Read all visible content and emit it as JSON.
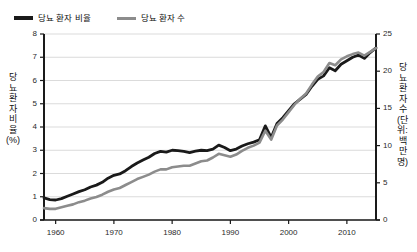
{
  "legend": {
    "position": "top-left",
    "items": [
      {
        "label": "당뇨 환자 비율",
        "color": "#1a1a1a",
        "icon": "line-swatch-icon"
      },
      {
        "label": "당뇨 환자 수",
        "color": "#8c8c8c",
        "icon": "line-swatch-icon"
      }
    ]
  },
  "axes": {
    "left": {
      "title": "당뇨 환자 비율(%)",
      "ticks": [
        "0",
        "1",
        "2",
        "3",
        "4",
        "5",
        "6",
        "7",
        "8"
      ],
      "min": 0,
      "max": 8
    },
    "right": {
      "title": "당뇨 환자 수(단위: 백만 명)",
      "ticks": [
        "0",
        "5",
        "10",
        "15",
        "20",
        "25"
      ],
      "min": 0,
      "max": 25
    },
    "bottom": {
      "title": "",
      "ticks": [
        "1960",
        "1970",
        "1980",
        "1990",
        "2000",
        "2010"
      ],
      "min": 1958,
      "max": 2015
    }
  },
  "chart_data": {
    "type": "line",
    "title": "",
    "subtitle": "",
    "xlabel": "",
    "ylabel": "당뇨 환자 비율(%)",
    "y2label": "당뇨 환자 수(단위: 백만 명)",
    "xlim": [
      1958,
      2015
    ],
    "ylim": [
      0,
      8
    ],
    "y2lim": [
      0,
      25
    ],
    "grid": true,
    "grid_axis": "y",
    "legend_position": "top-left",
    "x": [
      1958,
      1959,
      1960,
      1961,
      1962,
      1963,
      1964,
      1965,
      1966,
      1967,
      1968,
      1969,
      1970,
      1971,
      1972,
      1973,
      1974,
      1975,
      1976,
      1977,
      1978,
      1979,
      1980,
      1981,
      1982,
      1983,
      1984,
      1985,
      1986,
      1987,
      1988,
      1989,
      1990,
      1991,
      1992,
      1993,
      1994,
      1995,
      1996,
      1997,
      1998,
      1999,
      2000,
      2001,
      2002,
      2003,
      2004,
      2005,
      2006,
      2007,
      2008,
      2009,
      2010,
      2011,
      2012,
      2013,
      2014,
      2015
    ],
    "series": [
      {
        "name": "당뇨 환자 비율",
        "axis": "left",
        "unit": "%",
        "color": "#1a1a1a",
        "values": [
          0.95,
          0.88,
          0.86,
          0.92,
          1.02,
          1.12,
          1.22,
          1.3,
          1.42,
          1.5,
          1.62,
          1.8,
          1.92,
          1.98,
          2.12,
          2.3,
          2.45,
          2.58,
          2.7,
          2.86,
          2.95,
          2.92,
          3.0,
          2.98,
          2.95,
          2.9,
          2.96,
          3.0,
          2.98,
          3.05,
          3.22,
          3.12,
          2.98,
          3.05,
          3.18,
          3.28,
          3.35,
          3.45,
          4.05,
          3.55,
          4.15,
          4.4,
          4.7,
          5.0,
          5.2,
          5.4,
          5.75,
          6.05,
          6.2,
          6.55,
          6.42,
          6.7,
          6.85,
          7.0,
          7.1,
          6.95,
          7.2,
          7.4
        ]
      },
      {
        "name": "당뇨 환자 수",
        "axis": "right",
        "unit": "백만 명",
        "color": "#8c8c8c",
        "values": [
          1.6,
          1.5,
          1.5,
          1.7,
          1.9,
          2.1,
          2.4,
          2.6,
          2.9,
          3.1,
          3.4,
          3.8,
          4.1,
          4.3,
          4.7,
          5.1,
          5.5,
          5.8,
          6.1,
          6.5,
          6.8,
          6.8,
          7.1,
          7.2,
          7.3,
          7.3,
          7.6,
          7.9,
          8.0,
          8.4,
          8.9,
          8.7,
          8.5,
          8.8,
          9.3,
          9.7,
          10.0,
          10.4,
          12.0,
          10.8,
          12.7,
          13.5,
          14.5,
          15.5,
          16.3,
          17.0,
          18.2,
          19.3,
          19.9,
          21.1,
          20.8,
          21.6,
          22.0,
          22.3,
          22.5,
          22.1,
          22.6,
          23.1
        ]
      }
    ]
  }
}
